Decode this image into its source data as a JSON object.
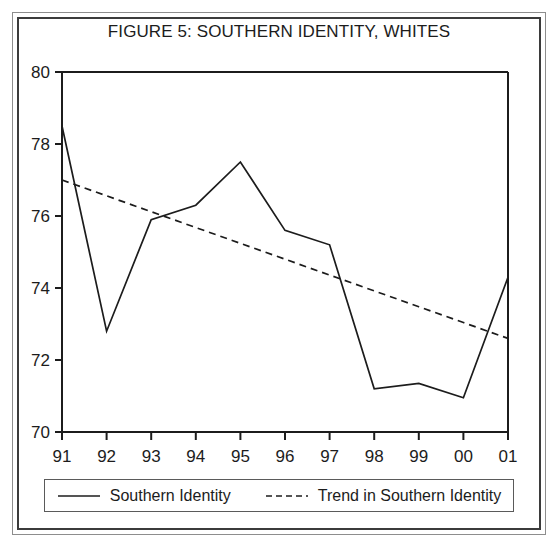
{
  "figure": {
    "title": "FIGURE 5: SOUTHERN IDENTITY, WHITES"
  },
  "legend": {
    "entries": [
      {
        "label": "Southern Identity",
        "style": "solid",
        "icon": "solid-line-swatch-icon"
      },
      {
        "label": "Trend in Southern Identity",
        "style": "dashed",
        "icon": "dashed-line-swatch-icon"
      }
    ]
  },
  "chart_data": {
    "type": "line",
    "title": "FIGURE 5: SOUTHERN IDENTITY, WHITES",
    "xlabel": "",
    "ylabel": "",
    "categories": [
      "91",
      "92",
      "93",
      "94",
      "95",
      "96",
      "97",
      "98",
      "99",
      "00",
      "01"
    ],
    "x_tick_labels": [
      "91",
      "92",
      "93",
      "94",
      "95",
      "96",
      "97",
      "98",
      "99",
      "00",
      "01"
    ],
    "y_tick_labels": [
      "70",
      "72",
      "74",
      "76",
      "78",
      "80"
    ],
    "y_ticks": [
      70,
      72,
      74,
      76,
      78,
      80
    ],
    "ylim": [
      70,
      80
    ],
    "grid": false,
    "legend_position": "bottom",
    "series": [
      {
        "name": "Southern Identity",
        "style": "solid",
        "color": "#1c1c1c",
        "values": [
          78.5,
          72.8,
          75.9,
          76.3,
          77.5,
          75.6,
          75.2,
          71.2,
          71.35,
          70.95,
          74.3
        ]
      },
      {
        "name": "Trend in Southern Identity",
        "style": "dashed",
        "color": "#1c1c1c",
        "values": [
          77.0,
          76.56,
          76.12,
          75.68,
          75.24,
          74.8,
          74.36,
          73.92,
          73.48,
          73.04,
          72.6
        ]
      }
    ]
  },
  "colors": {
    "line": "#1c1c1c",
    "axis": "#1c1c1c",
    "outer_border": "#8d8d8d",
    "inner_border": "#3b3b3b",
    "background": "#ffffff"
  }
}
